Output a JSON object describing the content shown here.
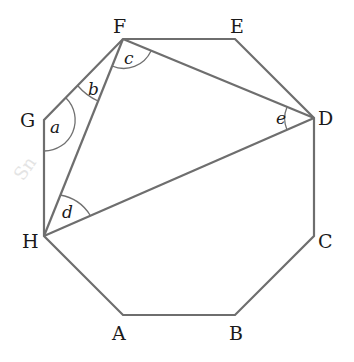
{
  "figure": {
    "vertices": {
      "A": {
        "label": "A",
        "x": 123,
        "y": 315
      },
      "B": {
        "label": "B",
        "x": 235,
        "y": 315
      },
      "C": {
        "label": "C",
        "x": 314,
        "y": 236
      },
      "D": {
        "label": "D",
        "x": 314,
        "y": 118
      },
      "E": {
        "label": "E",
        "x": 235,
        "y": 39
      },
      "F": {
        "label": "F",
        "x": 123,
        "y": 39
      },
      "G": {
        "label": "G",
        "x": 44,
        "y": 120
      },
      "H": {
        "label": "H",
        "x": 44,
        "y": 236
      }
    },
    "diagonals": [
      "FH",
      "FD",
      "HD"
    ],
    "angles": {
      "a": {
        "label": "a",
        "at": "G",
        "between": [
          "GF",
          "GH"
        ]
      },
      "b": {
        "label": "b",
        "at": "F",
        "between": [
          "FG",
          "FH"
        ]
      },
      "c": {
        "label": "c",
        "at": "F",
        "between": [
          "FH",
          "FD"
        ]
      },
      "d": {
        "label": "d",
        "at": "H",
        "between": [
          "HF",
          "HD"
        ]
      },
      "e": {
        "label": "e",
        "at": "D",
        "between": [
          "DF",
          "DH"
        ]
      }
    },
    "line_color": "#6e6e6e",
    "watermark": "Sn"
  }
}
